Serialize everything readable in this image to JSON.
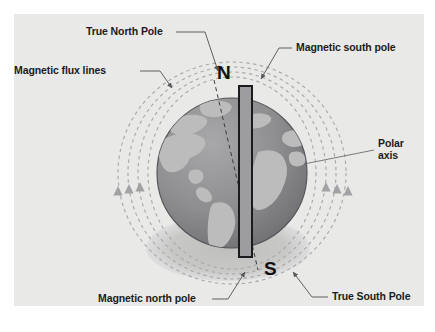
{
  "figure": {
    "background_color": "#e9e9e7",
    "page_color": "#ffffff"
  },
  "labels": {
    "true_north_pole": "True North Pole",
    "magnetic_south_pole": "Magnetic south pole",
    "magnetic_flux_lines": "Magnetic flux lines",
    "polar_axis_line1": "Polar",
    "polar_axis_line2": "axis",
    "magnetic_north_pole": "Magnetic north pole",
    "true_south_pole": "True South Pole"
  },
  "pole_markers": {
    "north": "N",
    "south": "S"
  },
  "colors": {
    "label_text": "#1c1c1c",
    "leader_line": "#58585a",
    "globe_ocean": "#8e8e90",
    "globe_land": "#b9b9ba",
    "globe_outline": "#4a4a4c",
    "flux_line": "#a9a9ab",
    "shadow": "#c3c3c2",
    "magnet_fill": "#9a9a9c",
    "magnet_stroke": "#1d1d1f"
  },
  "elements": {
    "bar_magnet": "vertical bar magnet inside globe",
    "polar_axis": "tilted dashed rotation axis through globe",
    "flux_arrow_count_left": 3,
    "flux_arrow_count_right": 3,
    "flux_ring_count": 4
  }
}
